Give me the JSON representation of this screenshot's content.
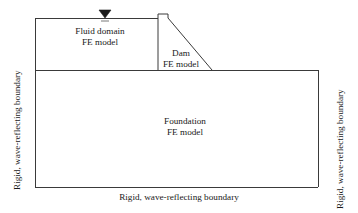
{
  "figure": {
    "type": "engineering-schematic",
    "line_color": "#3a3a3a",
    "fill_color": "#ffffff",
    "background": "#ffffff"
  },
  "regions": {
    "fluid": {
      "line1": "Fluid domain",
      "line2": "FE model"
    },
    "dam": {
      "line1": "Dam",
      "line2": "FE model"
    },
    "foundation": {
      "line1": "Foundation",
      "line2": "FE model"
    }
  },
  "boundaries": {
    "left": "Rigid, wave-reflecting boundary",
    "right": "Rigid, wave-reflecting boundary",
    "bottom": "Rigid, wave-reflecting boundary"
  },
  "markers": {
    "water_level": "water-level-triangle"
  },
  "geometry": {
    "reservoir": {
      "x1": 35,
      "y1": 18,
      "x2": 158,
      "y2": 70
    },
    "foundation": {
      "x1": 35,
      "y1": 70,
      "x2": 318,
      "y2": 187
    },
    "dam": {
      "crest_left": 158,
      "crest_right": 168,
      "crest_top": 14,
      "shoulder_y": 18,
      "toe_x": 212,
      "base_y": 70
    },
    "water_surface_marker": {
      "x": 105,
      "y": 18
    }
  }
}
